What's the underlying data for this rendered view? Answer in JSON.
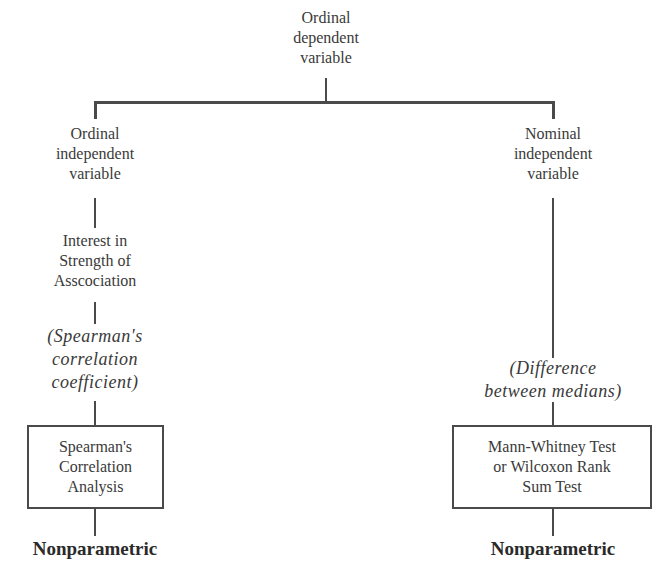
{
  "diagram": {
    "root": {
      "label": "Ordinal\ndependent\nvariable"
    },
    "left_branch": {
      "independent": "Ordinal\nindependent\nvariable",
      "interest": "Interest in\nStrength of\nAsscociation",
      "measure": "(Spearman's\ncorrelation\ncoefficient)",
      "test": "Spearman's\nCorrelation\nAnalysis",
      "category": "Nonparametric"
    },
    "right_branch": {
      "independent": "Nominal\nindependent\nvariable",
      "measure": "(Difference\nbetween medians)",
      "test": "Mann-Whitney Test\nor Wilcoxon Rank\nSum Test",
      "category": "Nonparametric"
    },
    "colors": {
      "line": "#4a4a4a",
      "text": "#3a3a3a",
      "background": "#ffffff"
    }
  }
}
